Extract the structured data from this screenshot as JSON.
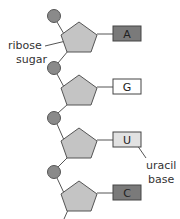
{
  "diagram": {
    "nucleotides": [
      {
        "base": "A",
        "base_fill": "#7a7a7a"
      },
      {
        "base": "G",
        "base_fill": "#ffffff"
      },
      {
        "base": "U",
        "base_fill": "#e2e2e2"
      },
      {
        "base": "C",
        "base_fill": "#7a7a7a"
      }
    ],
    "labels": {
      "sugar_line1": "ribose",
      "sugar_line2": "sugar",
      "base_line1": "uracil",
      "base_line2": "base"
    },
    "colors": {
      "phosphate": "#8a8a8a",
      "sugar": "#c4c4c4",
      "stroke": "#555555"
    }
  }
}
